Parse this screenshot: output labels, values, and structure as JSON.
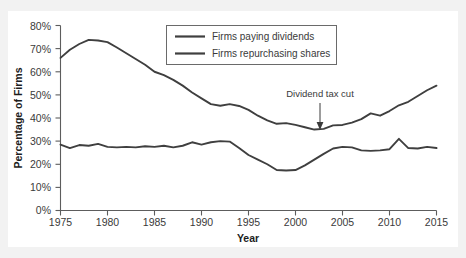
{
  "chart_data": {
    "type": "line",
    "title": "",
    "xlabel": "Year",
    "ylabel": "Percentage of Firms",
    "xlim": [
      1975,
      2015
    ],
    "ylim": [
      0,
      80
    ],
    "grid": false,
    "legend_position": "top-center",
    "xticks": [
      "1975",
      "1980",
      "1985",
      "1990",
      "1995",
      "2000",
      "2005",
      "2010",
      "2015"
    ],
    "yticks": [
      "0%",
      "10%",
      "20%",
      "30%",
      "40%",
      "50%",
      "60%",
      "70%",
      "80%"
    ],
    "x": [
      1975,
      1976,
      1977,
      1978,
      1979,
      1980,
      1981,
      1982,
      1983,
      1984,
      1985,
      1986,
      1987,
      1988,
      1989,
      1990,
      1991,
      1992,
      1993,
      1994,
      1995,
      1996,
      1997,
      1998,
      1999,
      2000,
      2001,
      2002,
      2003,
      2004,
      2005,
      2006,
      2007,
      2008,
      2009,
      2010,
      2011,
      2012,
      2013,
      2014,
      2015
    ],
    "series": [
      {
        "name": "Firms paying dividends",
        "color": "#3f3f3f",
        "values": [
          66.0,
          69.5,
          72.0,
          73.8,
          73.5,
          72.8,
          70.5,
          68.0,
          65.5,
          63.0,
          60.0,
          58.5,
          56.5,
          54.0,
          51.0,
          48.5,
          46.0,
          45.3,
          46.0,
          45.2,
          43.5,
          41.0,
          39.0,
          37.5,
          37.8,
          37.0,
          36.0,
          35.0,
          35.3,
          36.8,
          37.0,
          38.0,
          39.5,
          42.0,
          41.0,
          43.0,
          45.5,
          47.0,
          49.5,
          52.0,
          54.0
        ]
      },
      {
        "name": "Firms repurchasing shares",
        "color": "#3f3f3f",
        "values": [
          28.5,
          27.0,
          28.3,
          28.0,
          28.8,
          27.5,
          27.3,
          27.5,
          27.3,
          27.8,
          27.5,
          28.0,
          27.3,
          28.0,
          29.5,
          28.5,
          29.5,
          30.0,
          29.8,
          27.0,
          24.0,
          22.0,
          20.0,
          17.5,
          17.3,
          17.5,
          19.5,
          22.0,
          24.5,
          26.8,
          27.5,
          27.3,
          26.0,
          25.8,
          26.0,
          26.5,
          31.0,
          27.0,
          26.8,
          27.5,
          27.0
        ]
      }
    ],
    "annotations": [
      {
        "text": "Dividend tax cut",
        "x": 2003,
        "y": 35.3
      }
    ]
  },
  "legend": {
    "items": [
      {
        "label": "Firms paying dividends"
      },
      {
        "label": "Firms repurchasing shares"
      }
    ]
  },
  "axes": {
    "x_title": "Year",
    "y_title": "Percentage of Firms"
  }
}
